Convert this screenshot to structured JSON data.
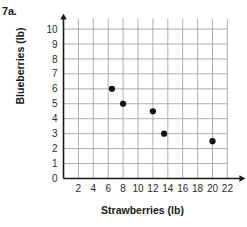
{
  "problem": {
    "label": "7a."
  },
  "chart_data": {
    "type": "scatter",
    "title": "",
    "xlabel": "Strawberries (lb)",
    "ylabel": "Blueberries (lb)",
    "xlim": [
      0,
      23
    ],
    "ylim": [
      0,
      10.7
    ],
    "xticks": [
      2,
      4,
      6,
      8,
      10,
      12,
      14,
      16,
      18,
      20,
      22
    ],
    "yticks": [
      0,
      1,
      2,
      3,
      4,
      5,
      6,
      7,
      8,
      9,
      10
    ],
    "grid": true,
    "legend": null,
    "point_color": "#111111",
    "grid_color": "#9a9a9a",
    "axis_color": "#1a1a1a",
    "points": [
      {
        "x": 6.5,
        "y": 6
      },
      {
        "x": 8,
        "y": 5
      },
      {
        "x": 12,
        "y": 4.5
      },
      {
        "x": 13.5,
        "y": 3
      },
      {
        "x": 20,
        "y": 2.5
      }
    ]
  }
}
